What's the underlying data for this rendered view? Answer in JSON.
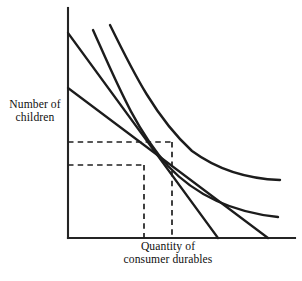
{
  "figure": {
    "name": "consumer-choice-indifference-diagram",
    "background_color": "#ffffff",
    "line_color": "#1c1c1c",
    "axis_color": "#242424"
  },
  "axes": {
    "y_label": "Number of\nchildren",
    "x_label": "Quantity of\nconsumer durables",
    "y_label_line1": "Number of",
    "y_label_line2": "children",
    "x_label_line1": "Quantity of",
    "x_label_line2": "consumer durables",
    "origin": [
      68,
      238
    ],
    "y_axis_top": [
      68,
      8
    ],
    "x_axis_right": [
      295,
      238
    ],
    "ticks_shown": false,
    "tick_labels": []
  },
  "chart_data": {
    "type": "line",
    "title": "",
    "subtitle": "",
    "xlabel": "Quantity of consumer durables",
    "ylabel": "Number of children",
    "xlim": [
      0,
      100
    ],
    "ylim": [
      0,
      100
    ],
    "grid": false,
    "legend": "none",
    "annotations": [],
    "series": [
      {
        "name": "budget-line-steep",
        "kind": "straight-budget-line",
        "points": [
          [
            68,
            33
          ],
          [
            218,
            238
          ]
        ]
      },
      {
        "name": "budget-line-shallow",
        "kind": "straight-budget-line",
        "points": [
          [
            68,
            88
          ],
          [
            268,
            238
          ]
        ]
      },
      {
        "name": "indifference-curve-inner",
        "kind": "convex-indifference-curve",
        "path": "M 93,30 C 118,86 136,130 168,166 C 200,200 240,213 278,217"
      },
      {
        "name": "indifference-curve-outer",
        "kind": "convex-indifference-curve",
        "path": "M 110,25 C 134,74 156,118 192,151 C 222,173 252,179 280,180"
      }
    ],
    "equilibrium_points": [
      {
        "name": "tangency-low",
        "x": 144,
        "y": 165,
        "guide_h_from": [
          68,
          165
        ],
        "guide_v_to": [
          144,
          238
        ]
      },
      {
        "name": "tangency-high",
        "x": 172,
        "y": 142,
        "guide_h_from": [
          68,
          142
        ],
        "guide_v_to": [
          172,
          238
        ]
      }
    ],
    "guides": [
      {
        "name": "dashed-horizontal-upper",
        "from": [
          68,
          142
        ],
        "to": [
          172,
          142
        ]
      },
      {
        "name": "dashed-horizontal-lower",
        "from": [
          68,
          165
        ],
        "to": [
          144,
          165
        ]
      },
      {
        "name": "dashed-vertical-left",
        "from": [
          144,
          165
        ],
        "to": [
          144,
          238
        ]
      },
      {
        "name": "dashed-vertical-right",
        "from": [
          172,
          142
        ],
        "to": [
          172,
          238
        ]
      }
    ]
  }
}
